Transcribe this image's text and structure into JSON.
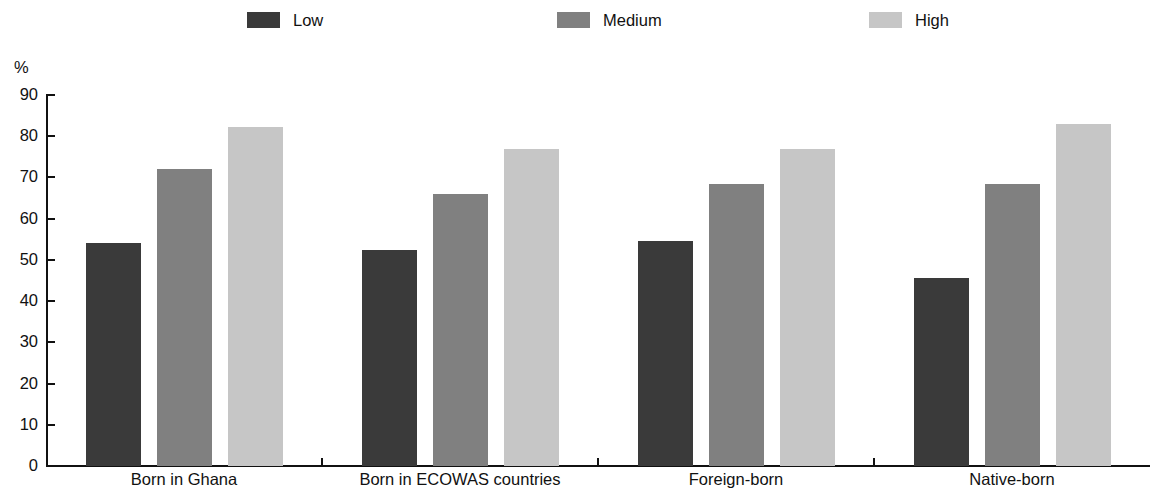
{
  "chart_data": {
    "type": "bar",
    "title": "",
    "subtitle": "",
    "xlabel": "",
    "ylabel": "%",
    "ylim": [
      0,
      90
    ],
    "ytick_step": 10,
    "yticks": [
      90,
      80,
      70,
      60,
      50,
      40,
      30,
      20,
      10,
      0
    ],
    "grid": false,
    "legend_position": "top",
    "categories": [
      "Born in Ghana",
      "Born in ECOWAS countries",
      "Foreign-born",
      "Native-born"
    ],
    "series": [
      {
        "name": "Low",
        "color": "#3a3a3a",
        "values": [
          54,
          52.3,
          54.7,
          45.6
        ]
      },
      {
        "name": "Medium",
        "color": "#808080",
        "values": [
          72,
          66,
          68.3,
          68.3
        ]
      },
      {
        "name": "High",
        "color": "#c6c6c6",
        "values": [
          82.2,
          76.8,
          77,
          83
        ]
      }
    ]
  },
  "axis": {
    "unit_label": "%",
    "tick_labels": [
      "90",
      "80",
      "70",
      "60",
      "50",
      "40",
      "30",
      "20",
      "10",
      "0"
    ]
  },
  "legend": {
    "items": [
      {
        "label": "Low",
        "color": "#3a3a3a"
      },
      {
        "label": "Medium",
        "color": "#808080"
      },
      {
        "label": "High",
        "color": "#c6c6c6"
      }
    ]
  }
}
